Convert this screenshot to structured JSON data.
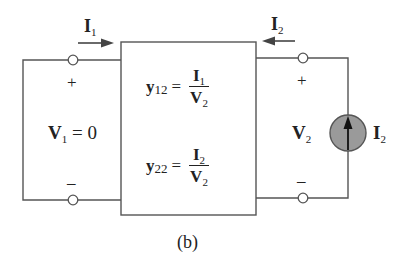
{
  "figure": {
    "caption": "(b)",
    "network": {
      "param_12": {
        "symbol": "y",
        "subscript": "12",
        "equals": "=",
        "numerator": {
          "symbol": "I",
          "subscript": "1"
        },
        "denominator": {
          "symbol": "V",
          "subscript": "2"
        }
      },
      "param_22": {
        "symbol": "y",
        "subscript": "22",
        "equals": "=",
        "numerator": {
          "symbol": "I",
          "subscript": "2"
        },
        "denominator": {
          "symbol": "V",
          "subscript": "2"
        }
      }
    },
    "port1": {
      "current": {
        "symbol": "I",
        "subscript": "1",
        "direction": "right"
      },
      "voltage": {
        "symbol": "V",
        "subscript": "1",
        "equals": "= 0"
      },
      "plus": "+",
      "minus": "–"
    },
    "port2": {
      "current": {
        "symbol": "I",
        "subscript": "2",
        "direction": "left"
      },
      "voltage": {
        "symbol": "V",
        "subscript": "2"
      },
      "plus": "+",
      "minus": "–",
      "source": {
        "type": "current-source",
        "symbol": "I",
        "subscript": "2",
        "arrow": "up"
      }
    },
    "colors": {
      "wire": "#555555",
      "source_fill": "#9a9a9a",
      "text": "#222222"
    }
  }
}
